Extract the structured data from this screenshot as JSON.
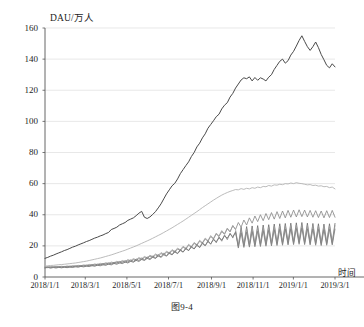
{
  "figure": {
    "caption": "图9-4",
    "y_axis_title": "DAU/万人",
    "x_axis_name": "时间"
  },
  "chart_data": {
    "type": "line",
    "title": "",
    "subtitle": "",
    "xlabel": "时间",
    "ylabel": "DAU/万人",
    "ylim": [
      0,
      160
    ],
    "yticks": [
      0,
      20,
      40,
      60,
      80,
      100,
      120,
      140,
      160
    ],
    "ytick_labels": [
      "0",
      "20",
      "40",
      "60",
      "80",
      "100",
      "120",
      "140",
      "160"
    ],
    "xlim": [
      "2018/1/1",
      "2019/3/1"
    ],
    "xticks": [
      "2018/1/1",
      "2018/3/1",
      "2018/5/1",
      "2018/7/1",
      "2018/9/1",
      "2018/11/1",
      "2019/1/1",
      "2019/3/1"
    ],
    "xtick_positions": [
      0.0,
      0.1389,
      0.2824,
      0.4259,
      0.5741,
      0.7176,
      0.8565,
      1.0
    ],
    "grid": {
      "horizontal": true,
      "vertical": false,
      "color": "#d9d9d9"
    },
    "legend": {
      "visible": false,
      "position": "none"
    },
    "annotations": [],
    "colors": {
      "total_dau": "#4a4a4a",
      "channel_a": "#b3b3b3",
      "channel_b": "#8a8a8a",
      "channel_c": "#6f6f6f",
      "channel_d": "#9c9c9c",
      "channel_e": "#7d7d7d",
      "axis": "#555555",
      "grid": "#dcdcdc"
    },
    "x_count": 106,
    "series": [
      {
        "name": "total_dau",
        "color": "#4a4a4a",
        "width": 1.0,
        "values": [
          12.0,
          12.6,
          13.4,
          14.0,
          14.8,
          15.5,
          16.2,
          17.0,
          17.6,
          18.4,
          19.2,
          19.8,
          20.6,
          21.3,
          22.0,
          22.8,
          23.4,
          24.2,
          25.0,
          25.6,
          26.4,
          27.0,
          27.9,
          28.6,
          30.5,
          31.2,
          32.0,
          33.4,
          34.2,
          35.0,
          36.4,
          37.2,
          38.0,
          39.4,
          41.0,
          42.2,
          38.4,
          37.6,
          38.6,
          40.2,
          42.0,
          44.4,
          47.0,
          50.2,
          53.4,
          56.0,
          58.6,
          60.2,
          63.0,
          66.4,
          69.0,
          71.6,
          74.0,
          77.4,
          80.0,
          83.6,
          86.0,
          89.4,
          92.0,
          95.6,
          98.0,
          100.4,
          103.0,
          104.6,
          108.0,
          110.4,
          112.0,
          115.6,
          118.0,
          121.4,
          124.0,
          126.6,
          128.0,
          127.4,
          128.6,
          126.0,
          128.2,
          126.4,
          128.0,
          127.2,
          126.0,
          128.4,
          130.0,
          133.4,
          136.0,
          138.6,
          140.0,
          137.4,
          139.0,
          142.6,
          145.0,
          148.4,
          152.0,
          155.0,
          151.4,
          148.0,
          145.6,
          148.0,
          151.0,
          147.4,
          143.0,
          139.6,
          136.0,
          134.4,
          137.0,
          135.0
        ]
      },
      {
        "name": "channel_a",
        "color": "#b3b3b3",
        "width": 0.9,
        "values": [
          7.0,
          7.2,
          7.4,
          7.5,
          7.7,
          7.9,
          8.0,
          8.2,
          8.4,
          8.6,
          8.8,
          9.0,
          9.3,
          9.6,
          9.9,
          10.2,
          10.6,
          11.0,
          11.4,
          11.8,
          12.2,
          12.7,
          13.2,
          13.7,
          14.2,
          14.8,
          15.4,
          16.0,
          16.6,
          17.2,
          17.9,
          18.6,
          19.3,
          20.0,
          20.8,
          21.6,
          22.4,
          23.2,
          24.0,
          24.9,
          25.8,
          26.7,
          27.6,
          28.6,
          29.6,
          30.6,
          31.6,
          32.7,
          33.8,
          34.9,
          36.0,
          37.2,
          38.4,
          39.6,
          40.8,
          42.0,
          43.3,
          44.6,
          45.8,
          47.0,
          48.2,
          49.4,
          50.5,
          51.6,
          52.6,
          53.5,
          54.3,
          55.0,
          55.6,
          56.2,
          56.0,
          56.8,
          56.3,
          57.0,
          56.6,
          57.4,
          57.0,
          57.8,
          57.4,
          58.2,
          58.0,
          58.8,
          58.4,
          59.2,
          59.0,
          59.6,
          59.3,
          60.0,
          59.8,
          60.4,
          60.0,
          60.6,
          60.2,
          60.0,
          59.6,
          59.2,
          59.4,
          58.8,
          59.0,
          58.4,
          58.6,
          58.0,
          58.2,
          57.4,
          57.8,
          56.6
        ]
      },
      {
        "name": "channel_b",
        "color": "#8a8a8a",
        "width": 0.85,
        "values": [
          6.2,
          6.0,
          6.4,
          6.1,
          6.5,
          6.2,
          6.6,
          6.3,
          6.7,
          6.4,
          6.9,
          6.6,
          7.1,
          6.8,
          7.3,
          7.0,
          7.6,
          7.2,
          7.9,
          7.5,
          8.2,
          7.8,
          8.6,
          8.2,
          9.0,
          8.6,
          9.5,
          9.0,
          10.0,
          9.5,
          10.6,
          10.0,
          11.2,
          10.6,
          11.9,
          11.2,
          12.6,
          11.9,
          13.4,
          12.6,
          14.2,
          13.4,
          15.1,
          14.2,
          16.0,
          15.0,
          17.0,
          16.0,
          18.0,
          17.0,
          19.2,
          18.0,
          20.4,
          19.2,
          21.6,
          20.4,
          23.0,
          21.6,
          24.4,
          23.0,
          26.0,
          24.4,
          27.6,
          26.0,
          29.2,
          27.4,
          31.0,
          29.0,
          33.0,
          30.6,
          35.0,
          32.0,
          36.6,
          33.4,
          38.0,
          34.6,
          39.2,
          35.6,
          40.0,
          36.2,
          40.8,
          36.8,
          41.4,
          37.2,
          42.0,
          37.6,
          42.4,
          38.0,
          42.8,
          38.4,
          43.0,
          38.6,
          43.2,
          38.8,
          43.0,
          38.6,
          42.8,
          38.4,
          42.6,
          38.2,
          42.4,
          38.0,
          42.6,
          38.2,
          42.8,
          38.4
        ]
      },
      {
        "name": "channel_c",
        "color": "#6f6f6f",
        "width": 0.85,
        "values": [
          5.8,
          6.2,
          5.7,
          6.1,
          5.8,
          6.2,
          5.9,
          6.3,
          6.0,
          6.4,
          6.1,
          6.6,
          6.3,
          6.8,
          6.5,
          7.0,
          6.7,
          7.3,
          6.9,
          7.6,
          7.2,
          7.9,
          7.5,
          8.3,
          7.8,
          8.7,
          8.2,
          9.1,
          8.6,
          9.6,
          9.0,
          10.1,
          9.5,
          10.7,
          10.0,
          11.3,
          10.6,
          12.0,
          11.2,
          12.7,
          11.9,
          13.5,
          12.6,
          14.3,
          13.4,
          15.2,
          14.2,
          16.1,
          15.0,
          17.0,
          16.0,
          18.1,
          17.0,
          19.2,
          18.0,
          20.3,
          19.0,
          21.5,
          20.2,
          22.7,
          21.4,
          24.0,
          22.6,
          25.2,
          23.8,
          26.4,
          25.0,
          27.6,
          26.0,
          28.6,
          20.0,
          32.0,
          20.4,
          32.4,
          20.8,
          32.8,
          21.0,
          33.0,
          21.2,
          33.4,
          21.4,
          33.6,
          21.6,
          34.0,
          21.8,
          34.2,
          22.0,
          34.4,
          22.2,
          34.6,
          22.4,
          34.8,
          22.6,
          35.0,
          22.4,
          34.6,
          22.2,
          34.4,
          22.0,
          34.2,
          21.8,
          34.0,
          22.0,
          34.2,
          22.2,
          34.4
        ]
      },
      {
        "name": "channel_d",
        "color": "#9c9c9c",
        "width": 0.8,
        "values": [
          6.6,
          6.3,
          6.7,
          6.4,
          6.8,
          6.5,
          6.9,
          6.6,
          7.1,
          6.8,
          7.3,
          7.0,
          7.5,
          7.2,
          7.8,
          7.4,
          8.1,
          7.7,
          8.4,
          8.0,
          8.8,
          8.3,
          9.2,
          8.7,
          9.6,
          9.1,
          10.1,
          9.5,
          10.6,
          10.0,
          11.2,
          10.5,
          11.8,
          11.1,
          12.5,
          11.7,
          13.2,
          12.4,
          14.0,
          13.1,
          14.8,
          13.9,
          15.7,
          14.7,
          16.6,
          15.5,
          17.6,
          16.4,
          18.6,
          17.4,
          19.8,
          18.4,
          21.0,
          19.6,
          22.2,
          20.8,
          23.6,
          22.0,
          25.0,
          23.4,
          26.6,
          24.8,
          28.2,
          26.4,
          29.8,
          27.8,
          31.4,
          29.2,
          33.0,
          30.4,
          19.4,
          30.6,
          19.8,
          31.0,
          20.0,
          31.4,
          20.2,
          31.6,
          20.4,
          32.0,
          20.6,
          32.2,
          20.8,
          32.6,
          21.0,
          32.8,
          21.2,
          33.0,
          21.4,
          33.2,
          21.6,
          33.4,
          21.8,
          33.6,
          21.6,
          33.2,
          21.4,
          33.0,
          21.2,
          32.8,
          21.0,
          32.6,
          21.2,
          32.8,
          21.4,
          33.0
        ]
      },
      {
        "name": "channel_e",
        "color": "#7d7d7d",
        "width": 0.8,
        "values": [
          6.0,
          6.5,
          6.1,
          6.6,
          6.2,
          6.7,
          6.3,
          6.8,
          6.4,
          7.0,
          6.6,
          7.2,
          6.8,
          7.4,
          7.0,
          7.7,
          7.2,
          8.0,
          7.5,
          8.3,
          7.8,
          8.7,
          8.1,
          9.1,
          8.4,
          9.5,
          8.8,
          10.0,
          9.2,
          10.5,
          9.6,
          11.0,
          10.0,
          11.6,
          10.5,
          12.2,
          11.0,
          12.9,
          11.6,
          13.6,
          12.2,
          14.4,
          12.9,
          15.2,
          13.6,
          16.0,
          14.4,
          16.9,
          15.2,
          17.8,
          16.0,
          18.8,
          17.0,
          19.9,
          18.0,
          21.0,
          19.0,
          22.2,
          20.0,
          23.4,
          21.0,
          24.6,
          22.0,
          25.8,
          23.0,
          27.0,
          24.0,
          28.2,
          25.0,
          29.2,
          18.6,
          28.4,
          19.0,
          28.8,
          19.2,
          29.2,
          19.4,
          29.4,
          19.6,
          29.8,
          19.8,
          30.0,
          20.0,
          30.4,
          20.2,
          30.6,
          20.4,
          30.8,
          20.6,
          31.0,
          20.8,
          31.2,
          21.0,
          31.4,
          20.8,
          31.0,
          20.6,
          30.8,
          20.4,
          30.6,
          20.2,
          30.4,
          20.4,
          30.6,
          20.6,
          30.8
        ]
      }
    ]
  }
}
